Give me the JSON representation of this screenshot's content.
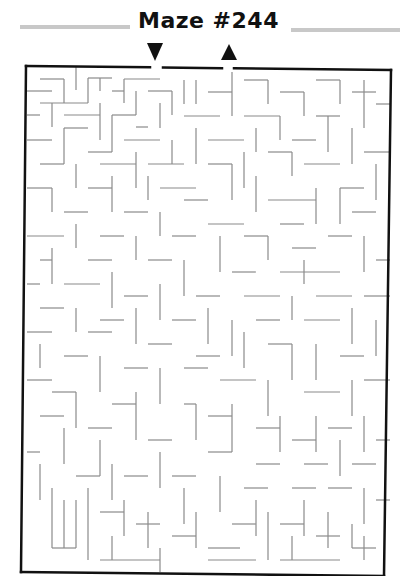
{
  "header": {
    "title": "Maze #244"
  },
  "colors": {
    "frame": "#111111",
    "wall": "#8a8a8a",
    "title_bar": "#c8c8c8",
    "arrow": "#111111"
  },
  "maze": {
    "start_label": "entrance-arrow-down",
    "end_label": "exit-arrow-up",
    "frame": {
      "top_left": [
        26,
        66
      ],
      "top_right": [
        391,
        70
      ],
      "bottom_right": [
        384,
        576
      ],
      "bottom_left": [
        21,
        572
      ]
    },
    "entrance_gap_x": [
      150,
      163
    ],
    "exit_gap_x": [
      222,
      234
    ],
    "entrance_arrow": {
      "x": 155,
      "y": 52,
      "direction": "down"
    },
    "exit_arrow": {
      "x": 229,
      "y": 52,
      "direction": "up"
    },
    "grid": {
      "cols": 30,
      "rows": 42,
      "cell_px": 12
    },
    "walls": [
      [
        76,
        67,
        76,
        90
      ],
      [
        40,
        79,
        64,
        79
      ],
      [
        64,
        79,
        64,
        103
      ],
      [
        27,
        91,
        52,
        91
      ],
      [
        88,
        78,
        112,
        78
      ],
      [
        88,
        78,
        88,
        103
      ],
      [
        100,
        78,
        100,
        91
      ],
      [
        124,
        79,
        160,
        79
      ],
      [
        124,
        79,
        124,
        103
      ],
      [
        112,
        91,
        124,
        91
      ],
      [
        136,
        91,
        136,
        115
      ],
      [
        148,
        91,
        172,
        91
      ],
      [
        172,
        91,
        172,
        115
      ],
      [
        40,
        103,
        88,
        103
      ],
      [
        52,
        103,
        52,
        127
      ],
      [
        27,
        115,
        40,
        115
      ],
      [
        64,
        115,
        100,
        115
      ],
      [
        100,
        103,
        100,
        140
      ],
      [
        112,
        115,
        136,
        115
      ],
      [
        112,
        115,
        112,
        152
      ],
      [
        136,
        127,
        148,
        127
      ],
      [
        160,
        103,
        160,
        128
      ],
      [
        184,
        80,
        184,
        104
      ],
      [
        196,
        80,
        196,
        104
      ],
      [
        208,
        92,
        232,
        92
      ],
      [
        232,
        72,
        232,
        116
      ],
      [
        244,
        80,
        268,
        80
      ],
      [
        268,
        80,
        268,
        104
      ],
      [
        280,
        92,
        304,
        92
      ],
      [
        304,
        92,
        304,
        116
      ],
      [
        316,
        80,
        340,
        80
      ],
      [
        340,
        80,
        340,
        104
      ],
      [
        352,
        92,
        376,
        92
      ],
      [
        364,
        80,
        364,
        128
      ],
      [
        376,
        104,
        390,
        104
      ],
      [
        184,
        116,
        220,
        116
      ],
      [
        244,
        116,
        280,
        116
      ],
      [
        280,
        116,
        280,
        140
      ],
      [
        316,
        116,
        340,
        116
      ],
      [
        328,
        116,
        328,
        152
      ],
      [
        352,
        128,
        352,
        164
      ],
      [
        196,
        128,
        196,
        164
      ],
      [
        208,
        140,
        244,
        140
      ],
      [
        256,
        128,
        256,
        152
      ],
      [
        292,
        140,
        316,
        140
      ],
      [
        27,
        140,
        52,
        140
      ],
      [
        64,
        128,
        88,
        128
      ],
      [
        64,
        128,
        64,
        164
      ],
      [
        124,
        140,
        160,
        140
      ],
      [
        172,
        140,
        172,
        164
      ],
      [
        88,
        152,
        112,
        152
      ],
      [
        40,
        164,
        64,
        164
      ],
      [
        76,
        164,
        76,
        188
      ],
      [
        100,
        164,
        136,
        164
      ],
      [
        136,
        152,
        136,
        188
      ],
      [
        148,
        164,
        184,
        164
      ],
      [
        208,
        164,
        232,
        164
      ],
      [
        232,
        164,
        232,
        200
      ],
      [
        244,
        152,
        244,
        188
      ],
      [
        268,
        152,
        292,
        152
      ],
      [
        292,
        152,
        292,
        176
      ],
      [
        304,
        164,
        340,
        164
      ],
      [
        364,
        152,
        390,
        152
      ],
      [
        376,
        164,
        376,
        200
      ],
      [
        27,
        188,
        52,
        188
      ],
      [
        52,
        188,
        52,
        212
      ],
      [
        88,
        188,
        112,
        188
      ],
      [
        112,
        176,
        112,
        212
      ],
      [
        148,
        176,
        148,
        200
      ],
      [
        160,
        188,
        196,
        188
      ],
      [
        184,
        200,
        208,
        200
      ],
      [
        256,
        176,
        256,
        212
      ],
      [
        268,
        200,
        316,
        200
      ],
      [
        316,
        188,
        316,
        224
      ],
      [
        340,
        188,
        364,
        188
      ],
      [
        340,
        188,
        340,
        224
      ],
      [
        64,
        212,
        88,
        212
      ],
      [
        124,
        212,
        148,
        212
      ],
      [
        160,
        212,
        160,
        236
      ],
      [
        208,
        224,
        244,
        224
      ],
      [
        280,
        224,
        304,
        224
      ],
      [
        352,
        212,
        376,
        212
      ],
      [
        27,
        236,
        64,
        236
      ],
      [
        76,
        224,
        76,
        248
      ],
      [
        100,
        236,
        124,
        236
      ],
      [
        136,
        236,
        136,
        260
      ],
      [
        172,
        236,
        196,
        236
      ],
      [
        220,
        236,
        220,
        272
      ],
      [
        244,
        236,
        268,
        236
      ],
      [
        268,
        236,
        268,
        260
      ],
      [
        292,
        248,
        316,
        248
      ],
      [
        328,
        236,
        352,
        236
      ],
      [
        364,
        236,
        364,
        272
      ],
      [
        376,
        260,
        390,
        260
      ],
      [
        40,
        260,
        52,
        260
      ],
      [
        52,
        248,
        52,
        284
      ],
      [
        88,
        260,
        112,
        260
      ],
      [
        148,
        260,
        172,
        260
      ],
      [
        184,
        260,
        184,
        296
      ],
      [
        232,
        272,
        256,
        272
      ],
      [
        280,
        272,
        340,
        272
      ],
      [
        304,
        260,
        304,
        284
      ],
      [
        27,
        284,
        40,
        284
      ],
      [
        64,
        284,
        100,
        284
      ],
      [
        112,
        272,
        112,
        308
      ],
      [
        124,
        296,
        148,
        296
      ],
      [
        160,
        284,
        160,
        320
      ],
      [
        196,
        296,
        220,
        296
      ],
      [
        244,
        296,
        280,
        296
      ],
      [
        292,
        296,
        292,
        320
      ],
      [
        316,
        296,
        352,
        296
      ],
      [
        364,
        296,
        390,
        296
      ],
      [
        40,
        308,
        64,
        308
      ],
      [
        76,
        308,
        76,
        332
      ],
      [
        100,
        320,
        124,
        320
      ],
      [
        136,
        308,
        136,
        344
      ],
      [
        172,
        320,
        196,
        320
      ],
      [
        208,
        308,
        208,
        344
      ],
      [
        232,
        320,
        232,
        356
      ],
      [
        256,
        320,
        280,
        320
      ],
      [
        304,
        320,
        340,
        320
      ],
      [
        352,
        308,
        352,
        344
      ],
      [
        376,
        320,
        376,
        356
      ],
      [
        27,
        332,
        52,
        332
      ],
      [
        88,
        332,
        112,
        332
      ],
      [
        148,
        344,
        172,
        344
      ],
      [
        196,
        356,
        220,
        356
      ],
      [
        244,
        332,
        244,
        368
      ],
      [
        268,
        344,
        292,
        344
      ],
      [
        292,
        344,
        292,
        380
      ],
      [
        316,
        344,
        316,
        380
      ],
      [
        340,
        356,
        364,
        356
      ],
      [
        40,
        344,
        40,
        368
      ],
      [
        64,
        356,
        88,
        356
      ],
      [
        100,
        356,
        100,
        392
      ],
      [
        124,
        368,
        148,
        368
      ],
      [
        160,
        368,
        160,
        404
      ],
      [
        184,
        368,
        208,
        368
      ],
      [
        220,
        380,
        256,
        380
      ],
      [
        268,
        380,
        268,
        416
      ],
      [
        304,
        392,
        340,
        392
      ],
      [
        352,
        380,
        352,
        416
      ],
      [
        364,
        380,
        390,
        380
      ],
      [
        27,
        380,
        52,
        380
      ],
      [
        52,
        392,
        76,
        392
      ],
      [
        76,
        392,
        76,
        428
      ],
      [
        112,
        404,
        136,
        404
      ],
      [
        136,
        392,
        136,
        440
      ],
      [
        184,
        404,
        196,
        404
      ],
      [
        196,
        404,
        196,
        440
      ],
      [
        208,
        416,
        232,
        416
      ],
      [
        232,
        404,
        232,
        452
      ],
      [
        256,
        428,
        280,
        428
      ],
      [
        280,
        416,
        280,
        452
      ],
      [
        292,
        440,
        316,
        440
      ],
      [
        316,
        416,
        316,
        452
      ],
      [
        328,
        428,
        352,
        428
      ],
      [
        340,
        440,
        340,
        476
      ],
      [
        364,
        416,
        364,
        452
      ],
      [
        376,
        440,
        390,
        440
      ],
      [
        40,
        416,
        64,
        416
      ],
      [
        64,
        428,
        64,
        464
      ],
      [
        88,
        428,
        112,
        428
      ],
      [
        100,
        440,
        100,
        476
      ],
      [
        148,
        440,
        172,
        440
      ],
      [
        160,
        452,
        160,
        488
      ],
      [
        208,
        452,
        232,
        452
      ],
      [
        256,
        464,
        280,
        464
      ],
      [
        304,
        464,
        328,
        464
      ],
      [
        352,
        464,
        376,
        464
      ],
      [
        27,
        452,
        40,
        452
      ],
      [
        40,
        464,
        40,
        500
      ],
      [
        76,
        476,
        100,
        476
      ],
      [
        112,
        464,
        112,
        500
      ],
      [
        124,
        476,
        148,
        476
      ],
      [
        172,
        476,
        196,
        476
      ],
      [
        184,
        488,
        184,
        524
      ],
      [
        220,
        476,
        220,
        512
      ],
      [
        244,
        488,
        268,
        488
      ],
      [
        256,
        500,
        256,
        536
      ],
      [
        292,
        488,
        316,
        488
      ],
      [
        304,
        500,
        304,
        536
      ],
      [
        328,
        488,
        352,
        488
      ],
      [
        364,
        488,
        364,
        524
      ],
      [
        376,
        500,
        390,
        500
      ],
      [
        52,
        488,
        52,
        548
      ],
      [
        64,
        500,
        64,
        548
      ],
      [
        76,
        500,
        76,
        548
      ],
      [
        88,
        488,
        88,
        560
      ],
      [
        100,
        512,
        124,
        512
      ],
      [
        124,
        500,
        124,
        536
      ],
      [
        136,
        524,
        160,
        524
      ],
      [
        148,
        512,
        148,
        548
      ],
      [
        172,
        536,
        196,
        536
      ],
      [
        196,
        512,
        196,
        548
      ],
      [
        208,
        548,
        240,
        548
      ],
      [
        232,
        524,
        256,
        524
      ],
      [
        268,
        512,
        268,
        560
      ],
      [
        280,
        524,
        304,
        524
      ],
      [
        292,
        536,
        292,
        560
      ],
      [
        316,
        536,
        340,
        536
      ],
      [
        328,
        512,
        328,
        548
      ],
      [
        352,
        548,
        376,
        548
      ],
      [
        364,
        536,
        364,
        560
      ],
      [
        100,
        560,
        160,
        560
      ],
      [
        160,
        548,
        160,
        572
      ],
      [
        52,
        548,
        76,
        548
      ],
      [
        112,
        536,
        112,
        560
      ],
      [
        208,
        560,
        256,
        560
      ],
      [
        280,
        560,
        340,
        560
      ],
      [
        352,
        524,
        352,
        548
      ]
    ]
  }
}
